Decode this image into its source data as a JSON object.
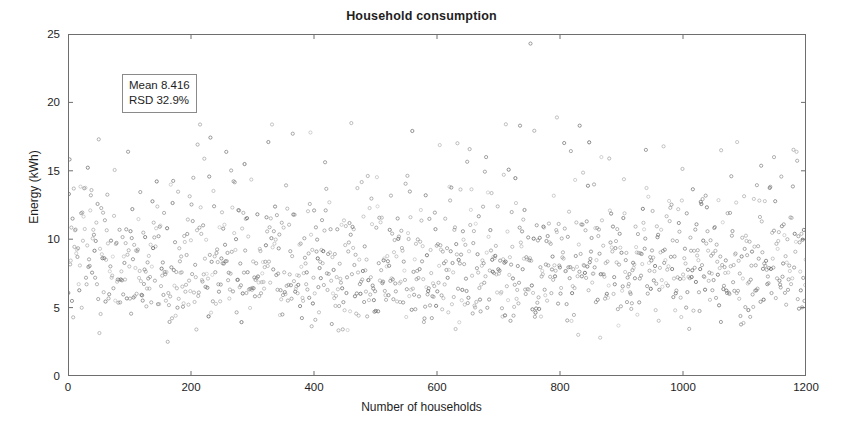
{
  "chart_data": {
    "type": "scatter",
    "title": "Household consumption",
    "xlabel": "Number of households",
    "ylabel": "Energy (kWh)",
    "xlim": [
      0,
      1200
    ],
    "ylim": [
      0,
      25
    ],
    "xticks": [
      0,
      200,
      400,
      600,
      800,
      1000,
      1200
    ],
    "yticks": [
      0,
      5,
      10,
      15,
      20,
      25
    ],
    "xtick_labels": [
      "0",
      "200",
      "400",
      "600",
      "800",
      "1000",
      "1200"
    ],
    "ytick_labels": [
      "0",
      "5",
      "10",
      "15",
      "20",
      "25"
    ],
    "grid": false,
    "legend": null,
    "marker": "open-circle",
    "marker_color": "#555555",
    "marker_size": 3.2,
    "n_points": 1210,
    "annotations": [
      {
        "name": "stats-box",
        "line1": "Mean 8.416",
        "line2": "RSD 32.9%",
        "x": 90,
        "y": 21.2
      }
    ],
    "summary_stats": {
      "mean": 8.416,
      "rsd_percent": 32.9,
      "sd": 2.769,
      "n": 1210
    },
    "series": [
      {
        "name": "Household energy consumption",
        "x_description": "household index 1..1210, uniformly spaced",
        "y_distribution": "lognormal-like, mean 8.416 kWh, sd 2.77 kWh, min ~1.6, max ~24.3",
        "notable_points": [
          {
            "x": 752,
            "y": 24.3
          },
          {
            "x": 795,
            "y": 18.9
          },
          {
            "x": 712,
            "y": 18.4
          },
          {
            "x": 735,
            "y": 18.3
          },
          {
            "x": 832,
            "y": 18.3
          },
          {
            "x": 50,
            "y": 17.3
          },
          {
            "x": 1088,
            "y": 17.1
          },
          {
            "x": 1062,
            "y": 16.5
          },
          {
            "x": 1148,
            "y": 16.0
          },
          {
            "x": 880,
            "y": 15.9
          }
        ]
      }
    ]
  },
  "axes": {
    "box": true,
    "tick_direction": "in",
    "line_color": "#6e6e6e"
  }
}
